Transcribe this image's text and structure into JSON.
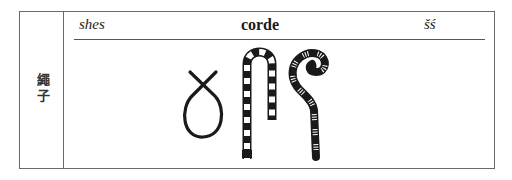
{
  "entry": {
    "side_label_chars": [
      "繩",
      "子"
    ],
    "side_label": "繩子",
    "transliteration": "shes",
    "meaning": "corde",
    "phonetic": "šś"
  },
  "glyphs": [
    {
      "name": "loop-rope-icon",
      "description": "knotted rope loop"
    },
    {
      "name": "hobble-rope-icon",
      "description": "banded rope bent in inverted U"
    },
    {
      "name": "coiled-rope-icon",
      "description": "banded rope with spiral top"
    }
  ],
  "colors": {
    "ink": "#1a1a1a",
    "frame": "#6a6a6a",
    "background": "#ffffff"
  }
}
